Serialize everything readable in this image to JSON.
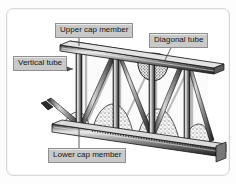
{
  "figure": {
    "type": "technical-illustration",
    "background_color": "#ffffff",
    "frame_color": "#d8d8d8",
    "line_color": "#1a1a1a",
    "fill_light": "#f2f2f2",
    "fill_mid": "#9a9a9a",
    "fill_dark": "#2a2a2a"
  },
  "labels": {
    "upper_cap": "Upper cap member",
    "diagonal_tube": "Diagonal tube",
    "vertical_tube": "Vertical tube",
    "lower_cap": "Lower cap member"
  },
  "callouts": [
    {
      "name": "upper-cap-member",
      "text": "Upper cap member",
      "leader": "vertical-down"
    },
    {
      "name": "diagonal-tube",
      "text": "Diagonal tube",
      "leader": "diagonal-down-left"
    },
    {
      "name": "vertical-tube",
      "text": "Vertical tube",
      "leader": "horizontal-right-arrow"
    },
    {
      "name": "lower-cap-member",
      "text": "Lower cap member",
      "leader": "vertical-up"
    }
  ],
  "components": [
    {
      "name": "upper-cap-member",
      "description": "sloping double-rail top chord"
    },
    {
      "name": "lower-cap-member",
      "description": "sloping double-rail bottom chord"
    },
    {
      "name": "vertical-tube",
      "description": "vertical web posts between chords"
    },
    {
      "name": "diagonal-tube",
      "description": "diagonal web braces forming triangles"
    },
    {
      "name": "concrete-infill",
      "description": "stippled concrete mass at joints"
    }
  ]
}
